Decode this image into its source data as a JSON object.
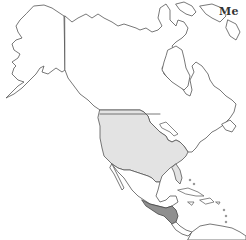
{
  "map": {
    "title_fragment": "Me",
    "region": "North America",
    "colors": {
      "background": "#ffffff",
      "land": "#ffffff",
      "outline": "#555555",
      "highlight_light": "#e3e3e3",
      "highlight_dark": "#8f8f8f"
    },
    "highlighted_regions": [
      {
        "name": "United States (contiguous)",
        "shade": "light"
      },
      {
        "name": "Central America (Guatemala, El Salvador, Honduras)",
        "shade": "dark"
      }
    ]
  }
}
